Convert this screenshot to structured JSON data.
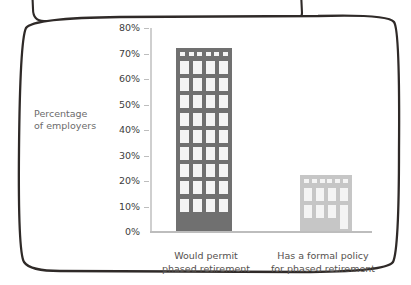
{
  "chart_data": {
    "type": "bar",
    "title": "",
    "subtitle": "",
    "xlabel": "",
    "ylabel": "Percentage of employers",
    "categories": [
      "Would permit phased retirement",
      "Has a formal policy for phased retirement"
    ],
    "values": [
      72,
      22
    ],
    "value_labels": [
      "72%",
      "22%"
    ],
    "ylim": [
      0,
      80
    ],
    "ytick_labels": [
      "80%",
      "70%",
      "60%",
      "50%",
      "40%",
      "30%",
      "20%",
      "10%",
      "0%"
    ],
    "ytick_values": [
      80,
      70,
      60,
      50,
      40,
      30,
      20,
      10,
      0
    ],
    "grid": false,
    "legend": "none",
    "series": [
      {
        "name": "Percentage of employers",
        "values": [
          72,
          22
        ]
      }
    ],
    "bar_style": "building-pictogram",
    "colors": {
      "bar_1": "#707070",
      "bar_2": "#c6c6c6",
      "window": "#f4f4f4",
      "axis": "#c4c4c4",
      "tick_text": "#3d3d3d",
      "axis_title": "#6b6b6b",
      "category_text": "#55514e",
      "frame_stroke": "#2f2a28",
      "background": "#ffffff"
    }
  },
  "axis": {
    "y_title_line1": "Percentage",
    "y_title_line2": "of employers"
  },
  "categories": {
    "cat1_line1": "Would permit",
    "cat1_line2": "phased retirement",
    "cat2_line1": "Has a formal policy",
    "cat2_line2": "for phased retirement"
  },
  "ticks": {
    "t80": "80%",
    "t70": "70%",
    "t60": "60%",
    "t50": "50%",
    "t40": "40%",
    "t30": "30%",
    "t20": "20%",
    "t10": "10%",
    "t0": "0%"
  }
}
